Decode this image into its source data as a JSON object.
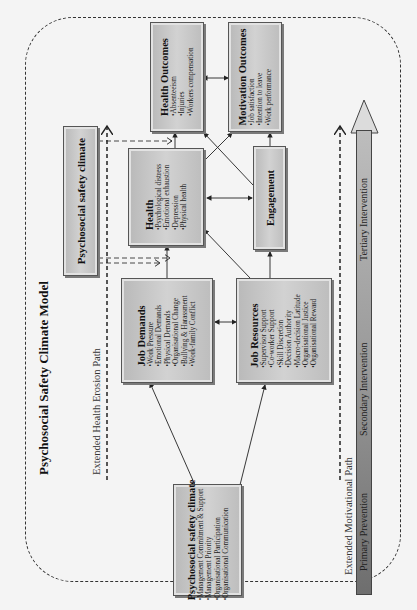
{
  "diagram": {
    "title": "Psychosocial Safety Climate Model",
    "orientation": "rotated 90deg counter-clockwise",
    "nodes": {
      "psc_antecedent": {
        "title": "Psychosocial safety climate",
        "items": [
          "Management Commitment & Support",
          "Management Priority",
          "Organisational Participation",
          "Organisational Communication"
        ]
      },
      "job_demands": {
        "title": "Job Demands",
        "items": [
          "Work Pressure",
          "Emotional Demands",
          "Physical Demands",
          "Organisational Change",
          "Bullying & Harassment",
          "Work-family Conflict"
        ]
      },
      "job_resources": {
        "title": "Job Resources",
        "items": [
          "Supervisor Support",
          "Co-worker Support",
          "Skill Discretion",
          "Decision Authority",
          "Macro-decision Latitude",
          "Organisational Justice",
          "Organisational Reward"
        ]
      },
      "health": {
        "title": "Health",
        "items": [
          "Psychological distress",
          "Emotional exhaustion",
          "Depression",
          "Physical health"
        ]
      },
      "engagement": {
        "title": "Engagement"
      },
      "health_outcomes": {
        "title": "Health Outcomes",
        "items": [
          "Absenteeism",
          "Injuries",
          "Workers compensation"
        ]
      },
      "motivation_outcomes": {
        "title": "Motivation Outcomes",
        "items": [
          "Job satisfaction",
          "Intention to leave",
          "Work performance"
        ]
      },
      "psc_moderator": {
        "title": "Psychosocial safety climate"
      }
    },
    "paths": {
      "health_erosion": "Extended Health Erosion Path",
      "motivational": "Extended Motivational Path"
    },
    "intervention_band": {
      "labels": [
        "Primary Prevention",
        "Secondary Intervention",
        "Tertiary Intervention"
      ]
    },
    "colors": {
      "background": "#f4f4f4",
      "box_fill": "#c6c6c6",
      "box_border": "#555555",
      "line": "#222222",
      "band_dark": "#6e6e6e",
      "band_light": "#bdbdbd"
    }
  }
}
